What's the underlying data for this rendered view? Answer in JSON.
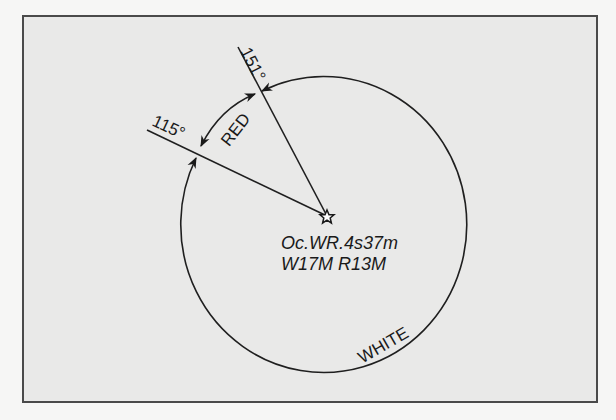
{
  "diagram": {
    "type": "light-sector-diagram",
    "light_position_icon": "star-icon",
    "sector_limits": [
      {
        "bearing_label": "115°",
        "bearing_deg": 115
      },
      {
        "bearing_label": "151°",
        "bearing_deg": 151
      }
    ],
    "sectors": [
      {
        "label": "RED",
        "from": "115°",
        "to": "151°"
      },
      {
        "label": "WHITE",
        "from": "151°",
        "to": "115°"
      }
    ],
    "light_characteristic": {
      "line1": "Oc.WR.4s37m",
      "line2": "W17M R13M"
    },
    "colors": {
      "frame_border": "#4a4a4a",
      "frame_background": "#e9e9e8",
      "line": "#1f1f1f"
    }
  }
}
